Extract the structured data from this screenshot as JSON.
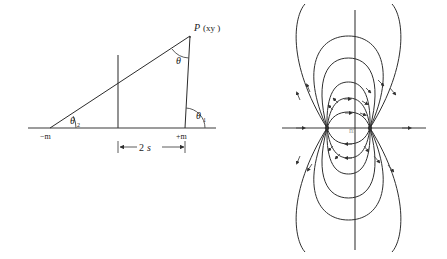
{
  "figure": {
    "background": "#ffffff",
    "stroke_color": "#2b2b2b",
    "width": 447,
    "height": 259
  },
  "left_panel": {
    "name": "magnetic-dipole-geometry",
    "description": "Triangle geometry for a bar magnet of pole strength m with half-separation s, field point P",
    "labels": {
      "point_p": "P",
      "point_p_coords": "(xy )",
      "theta": "θ",
      "theta1": "θ",
      "theta1_sub": "1",
      "theta2": "θ",
      "theta2_sub": "2",
      "neg_pole": "−m",
      "pos_pole": "+m",
      "separation": "2",
      "separation_italic": "s"
    },
    "geometry": {
      "axis_y": 128,
      "axis_x_start": 28,
      "axis_x_end": 216,
      "neg_pole_x": 50,
      "pos_pole_x": 185,
      "center_x": 118,
      "center_top_y": 55,
      "point_p_x": 190,
      "point_p_y": 36,
      "dimension_y": 147
    }
  },
  "right_panel": {
    "name": "dipole-field-lines",
    "description": "Magnetic field line pattern of a dipole with two poles on the horizontal axis",
    "labels": {
      "center_faint": "m"
    },
    "geometry": {
      "h_axis_y": 128,
      "h_axis_x_start": 282,
      "h_axis_x_end": 426,
      "v_axis_x": 355,
      "v_axis_y_start": 10,
      "v_axis_y_end": 250,
      "left_pole_x": 327,
      "right_pole_x": 370,
      "loop_count": 6
    }
  }
}
